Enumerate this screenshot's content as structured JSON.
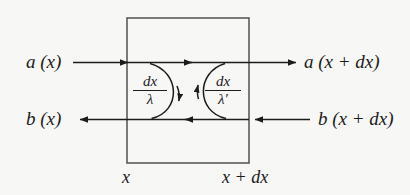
{
  "figure": {
    "type": "diagram",
    "background_color": "#f7f7f5",
    "line_color": "#1c1c1c",
    "box_border_color": "#5a5a5a",
    "box": {
      "left_boundary_label": "x",
      "right_boundary_label": "x + dx"
    },
    "flows": {
      "top_left_label": "a (x)",
      "top_right_label": "a (x + dx)",
      "bottom_left_label": "b (x)",
      "bottom_right_label": "b (x + dx)"
    },
    "coupling_terms": [
      {
        "name": "forward-to-backward",
        "numerator": "dx",
        "denominator": "λ",
        "direction": "downward"
      },
      {
        "name": "backward-to-forward",
        "numerator": "dx",
        "denominator": "λ′",
        "direction": "upward"
      }
    ]
  }
}
